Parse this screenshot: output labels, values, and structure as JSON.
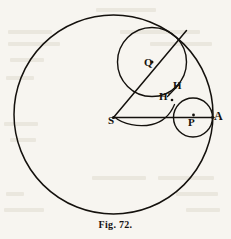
{
  "figure": {
    "caption": "Fig. 72.",
    "background_color": "#f7f5f0",
    "ink_color": "#14110d",
    "width": 231,
    "height": 239,
    "labels": {
      "center_S": "S",
      "center_Q": "Q",
      "center_P": "P",
      "point_A": "A",
      "point_H": "H",
      "point_H_prime": "H'"
    },
    "geometry": {
      "base_circle": {
        "cx": 113.5,
        "cy": 114.5,
        "r": 99.5,
        "label": "S"
      },
      "rolling_circle_large": {
        "cx": 152,
        "cy": 62,
        "r": 34.5,
        "label": "Q"
      },
      "rolling_circle_small": {
        "cx": 193,
        "cy": 117.5,
        "r": 19.5,
        "label": "P"
      },
      "radius_line_SA": {
        "x1": 113.5,
        "y1": 117.5,
        "x2": 213,
        "y2": 117.5
      },
      "radius_line_SQ": {
        "x1": 113.5,
        "y1": 117.5,
        "x2": 186.5,
        "y2": 30.5
      },
      "traced_curve": "epicycloid-arc-from-S-through-H-prime",
      "marked_points": [
        "S",
        "Q",
        "P",
        "A",
        "H",
        "H'"
      ]
    }
  }
}
